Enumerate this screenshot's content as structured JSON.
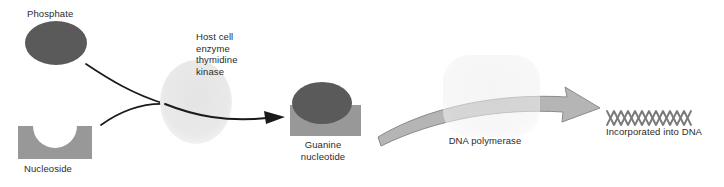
{
  "figure": {
    "background_color": "#ffffff"
  },
  "labels": {
    "phosphate": "Phosphate",
    "nucleoside": "Nucleoside",
    "host_enzyme": "Host cell\nenzyme\nthymidine\nkinase",
    "guanine_nucleotide": "Guanine\nnucleotide",
    "dna_polymerase": "DNA polymerase",
    "incorporated": "Incorporated into DNA"
  },
  "colors": {
    "phosphate_fill": "#5a5a5a",
    "nucleoside_fill": "#989898",
    "kinase_fill": "#e8e8e8",
    "polymerase_fill": "#efefef",
    "arrow_fill": "#b5b5b5",
    "arrow_stroke": "#8a8a8a",
    "thin_line": "#1a1a1a",
    "dna_stroke": "#7a7a7a",
    "text": "#2b2b2b"
  },
  "shapes": {
    "phosphate_oval": {
      "cx": 56,
      "cy": 43,
      "rx": 31,
      "ry": 22
    },
    "nucleoside_block": {
      "x": 18,
      "y": 126,
      "width": 74,
      "height": 33,
      "notch_radius": 22
    },
    "kinase_circle": {
      "cx": 196,
      "cy": 102,
      "rx": 36,
      "ry": 42
    },
    "guanine_block": {
      "x": 290,
      "y": 105,
      "width": 71,
      "height": 31
    },
    "guanine_oval": {
      "cx": 322,
      "cy": 103,
      "rx": 30,
      "ry": 21
    },
    "polymerase_box": {
      "x": 443,
      "y": 55,
      "width": 97,
      "height": 82,
      "radius": 26
    },
    "dna_helix": {
      "x": 607,
      "y": 118,
      "width": 86,
      "periods": 6,
      "amplitude": 7
    }
  },
  "connectors": {
    "phosphate_to_kinase": "curve from phosphate down-right to kinase edge",
    "nucleoside_to_kinase": "curve from nucleoside up-right to kinase edge",
    "kinase_to_guanine": "arrow from kinase to guanine nucleotide",
    "guanine_to_dna": "broad tapered arrow through DNA polymerase to DNA"
  }
}
